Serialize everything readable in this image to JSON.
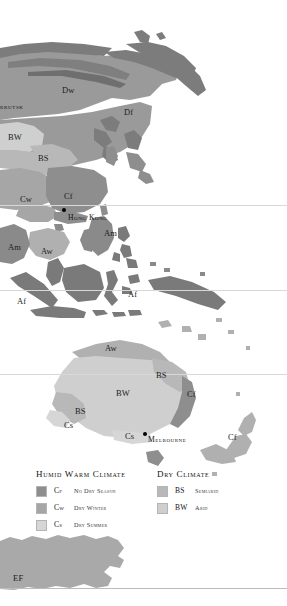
{
  "map": {
    "type": "koppen-climate-map",
    "region": "East Asia, Southeast Asia, Australia, New Zealand and Antarctica",
    "background_color": "#ffffff",
    "palette": {
      "cf_no_dry_season": "#8e8e8e",
      "cw_dry_winter": "#a6a6a6",
      "cs_dry_summer": "#d6d6d6",
      "bs_semiarid": "#b8b8b8",
      "bw_arid": "#cfcfcf",
      "dw_dry_winter_cold": "#9a9a9a",
      "df_no_dry_season_cold": "#7c7c7c",
      "af_rainforest": "#7a7a7a",
      "am_monsoon": "#8a8a8a",
      "aw_savanna": "#b0b0b0",
      "ef_icecap": "#a9a9a9",
      "gridline": "#d8d8d8",
      "city_marker": "#000000",
      "label_text": "#1c1c1c"
    },
    "climate_labels": [
      {
        "code": "Dw",
        "x": 62,
        "y": 86
      },
      {
        "code": "Df",
        "x": 124,
        "y": 108
      },
      {
        "code": "BW",
        "x": 8,
        "y": 133
      },
      {
        "code": "BS",
        "x": 38,
        "y": 154
      },
      {
        "code": "Cw",
        "x": 20,
        "y": 195
      },
      {
        "code": "Cf",
        "x": 64,
        "y": 192
      },
      {
        "code": "Am",
        "x": 104,
        "y": 229
      },
      {
        "code": "Am",
        "x": 8,
        "y": 243
      },
      {
        "code": "Aw",
        "x": 41,
        "y": 247
      },
      {
        "code": "Af",
        "x": 17,
        "y": 297
      },
      {
        "code": "Af",
        "x": 128,
        "y": 290
      },
      {
        "code": "Aw",
        "x": 105,
        "y": 344
      },
      {
        "code": "BS",
        "x": 156,
        "y": 371
      },
      {
        "code": "BW",
        "x": 116,
        "y": 389
      },
      {
        "code": "Cf",
        "x": 187,
        "y": 390
      },
      {
        "code": "BS",
        "x": 75,
        "y": 407
      },
      {
        "code": "Cs",
        "x": 64,
        "y": 421
      },
      {
        "code": "Cs",
        "x": 125,
        "y": 432
      },
      {
        "code": "Cf",
        "x": 228,
        "y": 433
      },
      {
        "code": "EF",
        "x": 13,
        "y": 574
      }
    ],
    "city_labels": [
      {
        "name": "Irkutsk",
        "x": -3,
        "y": 103,
        "dot_x": null,
        "dot_y": null,
        "truncated": true
      },
      {
        "name": "Hong Kong",
        "x": 68,
        "y": 214,
        "dot_x": 62,
        "dot_y": 208
      },
      {
        "name": "Melbourne",
        "x": 148,
        "y": 436,
        "dot_x": 143,
        "dot_y": 432
      }
    ],
    "gridlines_y": [
      205,
      290,
      374
    ]
  },
  "legend": {
    "humid": {
      "title": "Humid Warm Climate",
      "items": [
        {
          "code": "Cf",
          "description": "No Dry Season",
          "color": "#8e8e8e"
        },
        {
          "code": "Cw",
          "description": "Dry Winter",
          "color": "#a6a6a6"
        },
        {
          "code": "Cs",
          "description": "Dry Summer",
          "color": "#d6d6d6"
        }
      ]
    },
    "dry": {
      "title": "Dry Climate",
      "items": [
        {
          "code": "BS",
          "description": "Semiarid",
          "color": "#b8b8b8"
        },
        {
          "code": "BW",
          "description": "Arid",
          "color": "#cfcfcf"
        }
      ]
    }
  }
}
